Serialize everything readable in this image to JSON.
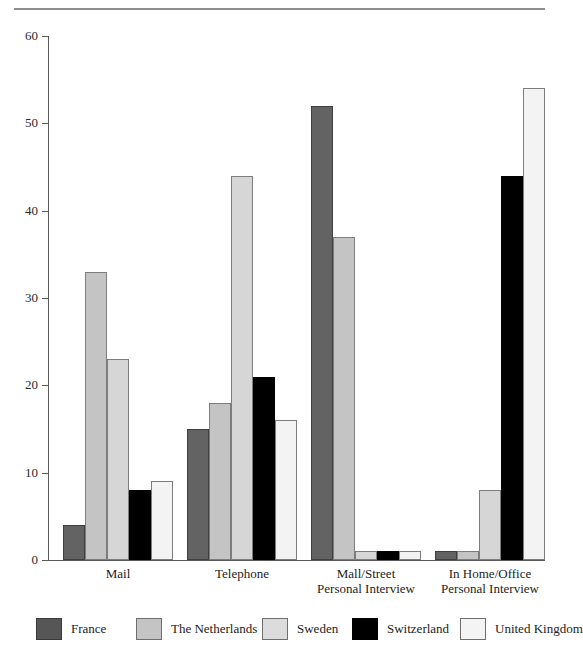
{
  "chart_data": {
    "type": "bar",
    "title": "",
    "subtitle": "",
    "xlabel": "",
    "ylabel": "",
    "ylim": [
      0,
      60
    ],
    "yticks": [
      0,
      10,
      20,
      30,
      40,
      50,
      60
    ],
    "ytick_labels": [
      "0",
      "10",
      "20",
      "30",
      "40",
      "50",
      "60"
    ],
    "grid": false,
    "legend_position": "bottom",
    "categories": [
      "Mail",
      "Telephone",
      "Mall/Street\nPersonal Interview",
      "In Home/Office\nPersonal Interview"
    ],
    "series": [
      {
        "name": "France",
        "color": "#636363",
        "values": [
          4,
          15,
          52,
          1
        ]
      },
      {
        "name": "The Netherlands",
        "color": "#c4c4c4",
        "values": [
          33,
          18,
          37,
          1
        ]
      },
      {
        "name": "Sweden",
        "color": "#d6d6d6",
        "values": [
          23,
          44,
          1,
          8
        ]
      },
      {
        "name": "Switzerland",
        "color": "#000000",
        "values": [
          8,
          21,
          1,
          44
        ]
      },
      {
        "name": "United Kingdom",
        "color": "#f3f3f3",
        "values": [
          9,
          16,
          1,
          54
        ]
      }
    ]
  },
  "legend": {
    "items": [
      {
        "label": "France"
      },
      {
        "label": "The Netherlands"
      },
      {
        "label": "Sweden"
      },
      {
        "label": "Switzerland"
      },
      {
        "label": "United Kingdom"
      }
    ]
  }
}
